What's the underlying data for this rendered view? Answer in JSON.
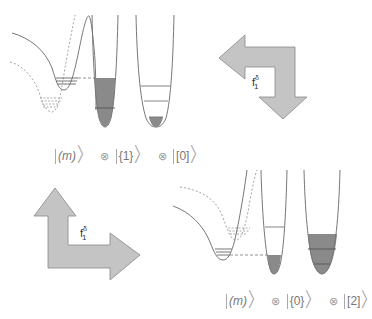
{
  "top_state": {
    "mode_m": "(m)",
    "mode_1": "{1}",
    "mode_2": "[0]",
    "tensor": "⊗"
  },
  "bottom_state": {
    "mode_m": "(m)",
    "mode_1": "{0}",
    "mode_2": "[2]",
    "tensor": "⊗"
  },
  "arrow_top_right": {
    "label_base": "f",
    "label_sup": "δ",
    "label_sub": "1",
    "direction": "left-and-down"
  },
  "arrow_bottom_left": {
    "label_base": "f",
    "label_sup": "δ",
    "label_sub": "1",
    "direction": "up-and-right"
  },
  "colors": {
    "arrow_fill": "#c4c4c4",
    "arrow_stroke": "#888888",
    "well_fill": "#8a8a8a",
    "line": "#777777"
  },
  "top_panel": {
    "well_1_filled_levels": 2,
    "well_2_filled_levels": 1
  },
  "bottom_panel": {
    "well_1_filled_levels": 1,
    "well_2_filled_levels": 3
  }
}
